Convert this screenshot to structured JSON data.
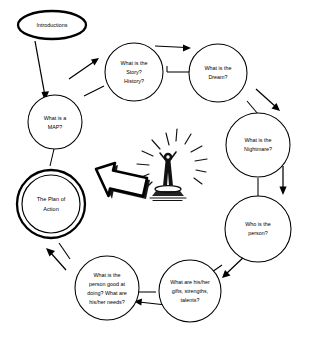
{
  "diagram": {
    "background_color": "#ffffff",
    "line_color": "#000000",
    "entry_node": {
      "id": "introductions",
      "label": "Introductions",
      "shape": "ellipse",
      "emphasis": "bold"
    },
    "highlight_node": {
      "id": "plan-of-action",
      "label_line1": "The Plan of",
      "label_line2": "Action",
      "shape": "double-circle",
      "emphasis": "bold"
    },
    "nodes": [
      {
        "id": "what-is-a-map",
        "lines": [
          "What is a",
          "MAP?"
        ],
        "shape": "circle"
      },
      {
        "id": "story-history",
        "lines": [
          "What is the",
          "Story?",
          "History?"
        ],
        "shape": "circle"
      },
      {
        "id": "dream",
        "lines": [
          "What is the",
          "Dream?"
        ],
        "shape": "circle"
      },
      {
        "id": "nightmare",
        "lines": [
          "What is the",
          "Nightmare?"
        ],
        "shape": "circle"
      },
      {
        "id": "who-is-the-person",
        "lines": [
          "Who is the",
          "person?"
        ],
        "shape": "circle"
      },
      {
        "id": "gifts-strengths-talents",
        "lines": [
          "What are his/her",
          "gifts, strengths,",
          "talents?"
        ],
        "shape": "circle"
      },
      {
        "id": "good-at-needs",
        "lines": [
          "What is the",
          "person good at",
          "doing? What are",
          "his/her needs?"
        ],
        "shape": "circle"
      }
    ],
    "center_illustration": {
      "id": "celebrating-person",
      "description": "Hand-drawn person with raised arms standing on a platform with radiating rays"
    },
    "block_arrow": {
      "id": "big-arrow-to-plan",
      "direction": "left",
      "description": "Large hand-drawn block arrow pointing from the center illustration toward the Plan of Action"
    },
    "flow_arrows": [
      {
        "from": "introductions",
        "to": "what-is-a-map",
        "direction": "down-left"
      },
      {
        "from": "what-is-a-map",
        "to": "story-history",
        "direction": "up-right"
      },
      {
        "from": "story-history",
        "to": "dream",
        "direction": "right"
      },
      {
        "from": "dream",
        "to": "nightmare",
        "direction": "down-right"
      },
      {
        "from": "nightmare",
        "to": "who-is-the-person",
        "direction": "down"
      },
      {
        "from": "who-is-the-person",
        "to": "gifts-strengths-talents",
        "direction": "down-left"
      },
      {
        "from": "gifts-strengths-talents",
        "to": "good-at-needs",
        "direction": "left"
      },
      {
        "from": "good-at-needs",
        "to": "plan-of-action",
        "direction": "up-left"
      }
    ]
  }
}
